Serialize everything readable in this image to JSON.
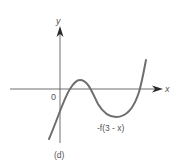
{
  "figure": {
    "panel_label": "(d)",
    "x_axis_label": "x",
    "y_axis_label": "y",
    "origin_label": "0",
    "curve_label": "-f(3 - x)"
  },
  "colors": {
    "axis": "#3a3a3a",
    "curve": "#6a6a6a",
    "text": "#555555"
  }
}
